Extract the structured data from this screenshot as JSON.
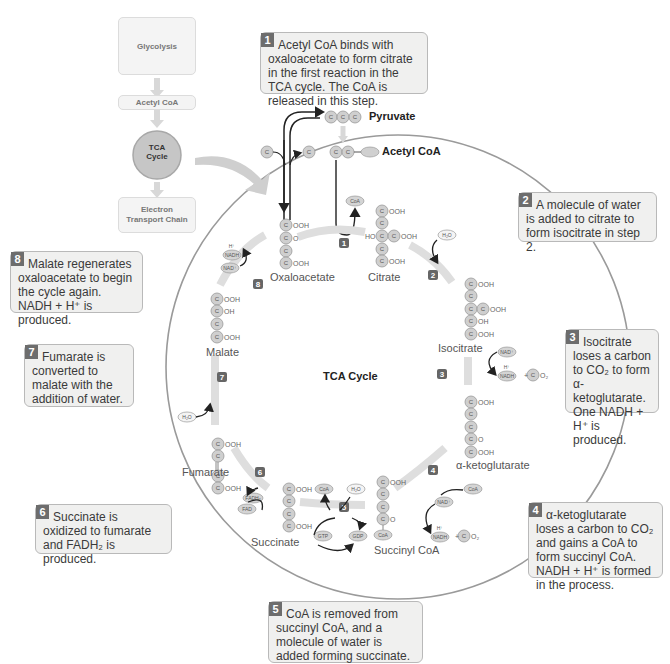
{
  "overview_flow": {
    "glycolysis": "Glycolysis",
    "acetyl_coa": "Acetyl CoA",
    "tca_cycle_line1": "TCA",
    "tca_cycle_line2": "Cycle",
    "etc_line1": "Electron",
    "etc_line2": "Transport Chain"
  },
  "inputs": {
    "pyruvate": "Pyruvate",
    "acetyl_coa": "Acetyl CoA",
    "carbon_symbol": "C",
    "coa_symbol": "CoA"
  },
  "cycle_title": "TCA Cycle",
  "molecules": {
    "oxaloacetate": "Oxaloacetate",
    "citrate": "Citrate",
    "isocitrate": "Isocitrate",
    "alpha_ketoglutarate": "α-ketoglutarate",
    "succinyl_coa": "Succinyl CoA",
    "succinate": "Succinate",
    "fumarate": "Fumarate",
    "malate": "Malate"
  },
  "cofactors": {
    "coa": "CoA",
    "h2o": "H₂O",
    "nad_plus": "NAD⁺",
    "nadh": "NADH",
    "h_plus": "H⁺",
    "co2_suffix": "O₂",
    "fad": "FAD",
    "fadh2": "FADH₂",
    "gtp": "GTP",
    "gdp": "GDP"
  },
  "step_badges": [
    "1",
    "2",
    "3",
    "4",
    "5",
    "6",
    "7",
    "8"
  ],
  "callouts": [
    {
      "num": "1",
      "text": "Acetyl CoA binds with oxaloacetate to form citrate in the first reaction in the TCA cycle. The CoA is released in this step."
    },
    {
      "num": "2",
      "text": "A molecule of water is added to citrate to form isocitrate in step 2."
    },
    {
      "num": "3",
      "text": "Isocitrate loses a carbon to CO₂ to form α-ketoglutarate. One NADH + H⁺ is produced."
    },
    {
      "num": "4",
      "text": "α-ketoglutarate loses a carbon to CO₂ and gains a CoA to form succinyl CoA. NADH + H⁺ is formed in the process."
    },
    {
      "num": "5",
      "text": "CoA is removed from succinyl CoA, and a molecule of water is added forming succinate. GTP is produced."
    },
    {
      "num": "6",
      "text": "Succinate is oxidized to fumarate and FADH₂ is produced."
    },
    {
      "num": "7",
      "text": "Fumarate is converted to malate with the addition of water."
    },
    {
      "num": "8",
      "text": "Malate regenerates oxaloacetate to begin the cycle again. NADH + H⁺ is produced."
    }
  ]
}
